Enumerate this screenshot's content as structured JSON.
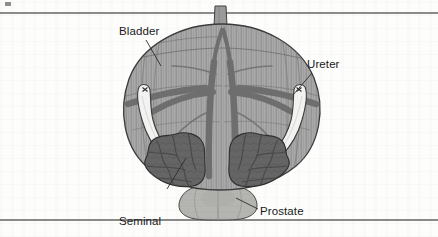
{
  "figure": {
    "kind": "anatomical-illustration",
    "labels": {
      "bladder": "Bladder",
      "ureter": "Ureter",
      "seminal_vesicle_line1": "Seminal",
      "seminal_vesicle_line2": "vesicle",
      "prostate": "Prostate"
    },
    "structures": [
      {
        "name": "bladder",
        "label": "Bladder",
        "fill": "#a9a9a9",
        "description": "Large rounded organ with vertical detrusor muscle striations"
      },
      {
        "name": "ureter-left",
        "label": "Ureter",
        "fill": "#f2f2f0",
        "description": "Pale tube descending into bladder wall"
      },
      {
        "name": "ureter-right",
        "label": "Ureter",
        "fill": "#f2f2f0",
        "description": "Pale tube descending into bladder wall"
      },
      {
        "name": "seminal-vesicle-left",
        "label": "Seminal vesicle",
        "fill": "#656565",
        "description": "Dark convoluted lobulated sac"
      },
      {
        "name": "seminal-vesicle-right",
        "label": "Seminal vesicle",
        "fill": "#656565",
        "description": "Dark convoluted lobulated sac"
      },
      {
        "name": "prostate",
        "label": "Prostate",
        "fill": "#b5b5b2",
        "description": "Light lobed gland below the bladder base"
      },
      {
        "name": "vas-deferens",
        "label": "",
        "fill": "#6e6e6e",
        "description": "Dark branching ducts crossing the bladder"
      },
      {
        "name": "urachus",
        "label": "",
        "fill": "#9a9a9a",
        "description": "Small stalk at the bladder apex"
      }
    ],
    "colors": {
      "background": "#fdfdfc",
      "rule": "#8a8a8a",
      "bladder": "#a9a9a9",
      "bladder_stripe": "#7e7e7e",
      "seminal_vesicle": "#656565",
      "prostate": "#b5b5b2",
      "duct": "#6e6e6e",
      "ureter": "#f2f2f0",
      "outline": "#3b3b3b",
      "label_text": "#1a1a1a",
      "leader_line": "#2b2b2b"
    }
  }
}
